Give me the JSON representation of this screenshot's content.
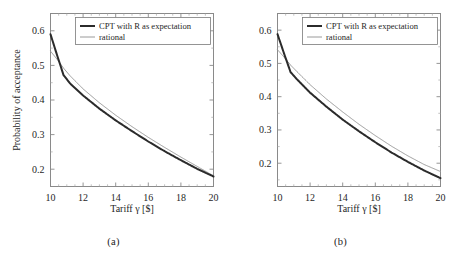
{
  "figure": {
    "background": "#ffffff",
    "panels": [
      {
        "id": "panel-a",
        "subcaption": "(a)"
      },
      {
        "id": "panel-b",
        "subcaption": "(b)"
      }
    ]
  },
  "chart_data": [
    {
      "type": "line",
      "title": "",
      "subcaption": "(a)",
      "xlabel": "Tariff γ [$]",
      "ylabel": "Probability of acceptance",
      "xlim": [
        10,
        20
      ],
      "ylim": [
        0.15,
        0.65
      ],
      "xticks": [
        10,
        12,
        14,
        16,
        18,
        20
      ],
      "xticklabels": [
        "10",
        "12",
        "14",
        "16",
        "18",
        "20"
      ],
      "yticks": [
        0.2,
        0.3,
        0.4,
        0.5,
        0.6
      ],
      "yticklabels": [
        "0.2",
        "0.3",
        "0.4",
        "0.5",
        "0.6"
      ],
      "grid": false,
      "legend_position": "upper right",
      "series": [
        {
          "name": "CPT with R as expectation",
          "color": "#2b2b2b",
          "linewidth": 2.0,
          "x": [
            10.0,
            10.4,
            10.8,
            11.2,
            12.0,
            13.0,
            14.0,
            15.0,
            16.0,
            17.0,
            18.0,
            19.0,
            20.0
          ],
          "values": [
            0.59,
            0.53,
            0.472,
            0.448,
            0.413,
            0.375,
            0.341,
            0.31,
            0.28,
            0.252,
            0.226,
            0.201,
            0.179
          ]
        },
        {
          "name": "rational",
          "color": "#9a9a9a",
          "linewidth": 1.0,
          "x": [
            10.0,
            10.4,
            10.8,
            11.2,
            12.0,
            13.0,
            14.0,
            15.0,
            16.0,
            17.0,
            18.0,
            19.0,
            20.0
          ],
          "values": [
            0.541,
            0.518,
            0.492,
            0.47,
            0.432,
            0.392,
            0.356,
            0.323,
            0.292,
            0.263,
            0.235,
            0.208,
            0.181
          ]
        }
      ]
    },
    {
      "type": "line",
      "title": "",
      "subcaption": "(b)",
      "xlabel": "Tariff γ [$]",
      "ylabel": "",
      "xlim": [
        10,
        20
      ],
      "ylim": [
        0.13,
        0.65
      ],
      "xticks": [
        10,
        12,
        14,
        16,
        18,
        20
      ],
      "xticklabels": [
        "10",
        "12",
        "14",
        "16",
        "18",
        "20"
      ],
      "yticks": [
        0.2,
        0.3,
        0.4,
        0.5,
        0.6
      ],
      "yticklabels": [
        "0.2",
        "0.3",
        "0.4",
        "0.5",
        "0.6"
      ],
      "grid": false,
      "legend_position": "upper right",
      "series": [
        {
          "name": "CPT with R as expectation",
          "color": "#2b2b2b",
          "linewidth": 2.0,
          "x": [
            10.0,
            10.4,
            10.8,
            11.2,
            12.0,
            13.0,
            14.0,
            15.0,
            16.0,
            17.0,
            18.0,
            19.0,
            20.0
          ],
          "values": [
            0.588,
            0.53,
            0.474,
            0.452,
            0.412,
            0.37,
            0.331,
            0.296,
            0.263,
            0.232,
            0.204,
            0.178,
            0.155
          ]
        },
        {
          "name": "rational",
          "color": "#9a9a9a",
          "linewidth": 1.0,
          "x": [
            10.0,
            10.4,
            10.8,
            11.2,
            12.0,
            13.0,
            14.0,
            15.0,
            16.0,
            17.0,
            18.0,
            19.0,
            20.0
          ],
          "values": [
            0.541,
            0.519,
            0.495,
            0.475,
            0.436,
            0.393,
            0.354,
            0.317,
            0.283,
            0.251,
            0.222,
            0.196,
            0.175
          ]
        }
      ]
    }
  ],
  "legend": {
    "entries": [
      {
        "label": "CPT with R as expectation",
        "color": "#2b2b2b",
        "linewidth": 2.0
      },
      {
        "label": "rational",
        "color": "#9a9a9a",
        "linewidth": 1.0
      }
    ]
  },
  "axes": {
    "xlabel": "Tariff γ [$]",
    "ylabel": "Probability of acceptance"
  },
  "colors": {
    "cpt_line": "#2b2b2b",
    "rational_line": "#9a9a9a",
    "axis": "#5a5a5a",
    "text": "#1f1f1f",
    "background": "#ffffff"
  }
}
